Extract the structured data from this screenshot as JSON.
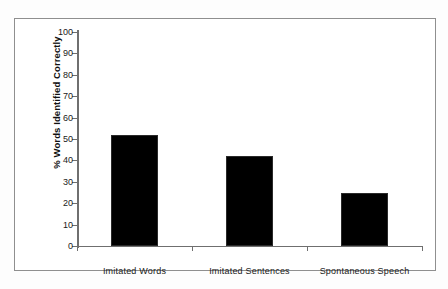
{
  "figure": {
    "background_color": "#ffffff",
    "frame_color": "#8f8f8f",
    "bar_color": "#000000",
    "axis_color": "#6f6f6f"
  },
  "chart_data": {
    "type": "bar",
    "title": "",
    "xlabel": "",
    "ylabel": "% Words Identified Correctly",
    "categories": [
      "Imitated Words",
      "Imitated Sentences",
      "Spontaneous Speech"
    ],
    "values": [
      52,
      42,
      25
    ],
    "ylim": [
      0,
      100
    ],
    "ytick_values": [
      0,
      10,
      20,
      30,
      40,
      50,
      60,
      70,
      80,
      90,
      100
    ],
    "ytick_labels": [
      "0",
      "10",
      "20",
      "30",
      "40",
      "50",
      "60",
      "70",
      "80",
      "90",
      "100"
    ],
    "grid": false,
    "legend": false,
    "legend_position": "none"
  }
}
